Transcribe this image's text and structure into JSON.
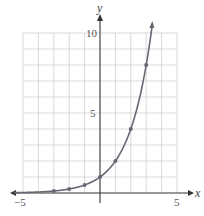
{
  "chart_data": {
    "type": "line",
    "title": "",
    "function": "y = 2^x",
    "xlabel": "x",
    "ylabel": "y",
    "xlim": [
      -5,
      5
    ],
    "ylim": [
      0,
      10
    ],
    "grid": true,
    "x_ticks_labeled": [
      "−5",
      "5"
    ],
    "y_ticks_labeled": [
      "5",
      "10"
    ],
    "points": [
      {
        "x": -3,
        "y": 0.125
      },
      {
        "x": -2,
        "y": 0.25
      },
      {
        "x": -1,
        "y": 0.5
      },
      {
        "x": 0,
        "y": 1
      },
      {
        "x": 1,
        "y": 2
      },
      {
        "x": 2,
        "y": 4
      },
      {
        "x": 3,
        "y": 8
      }
    ],
    "curve_x_range": [
      -5.6,
      3.4
    ],
    "colors": {
      "curve": "#6b6572",
      "grid": "#cfcfcf",
      "axes": "#333333"
    }
  },
  "labels": {
    "x_axis": "x",
    "y_axis": "y",
    "x_min": "−5",
    "x_max": "5",
    "y_mid": "5",
    "y_max": "10"
  }
}
